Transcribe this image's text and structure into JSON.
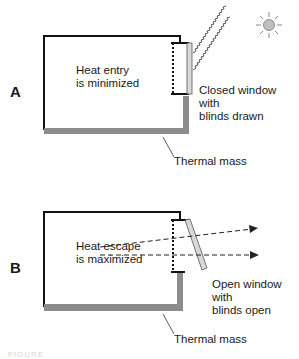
{
  "diagram": {
    "panels": [
      {
        "id": "A",
        "letter": "A",
        "room_label": "Heat entry\nis minimized",
        "window_label": "Closed window\nwith\nblinds drawn",
        "mass_label": "Thermal mass",
        "window_state": "closed",
        "blinds_state": "drawn",
        "heat_source": "sun-icon",
        "rays": "wavy radiation lines from sun to window"
      },
      {
        "id": "B",
        "letter": "B",
        "room_label": "Heat escape\nis maximized",
        "window_label": "Open window\nwith\nblinds open",
        "mass_label": "Thermal mass",
        "window_state": "open",
        "blinds_state": "open",
        "airflow": "two dashed arrows exiting through window"
      }
    ],
    "colors": {
      "wall": "#111111",
      "thermal_mass": "#8c8c8c",
      "blinds": "#d9d9d9",
      "sun": "#bfbfbf"
    },
    "caption": "FIGURE"
  }
}
